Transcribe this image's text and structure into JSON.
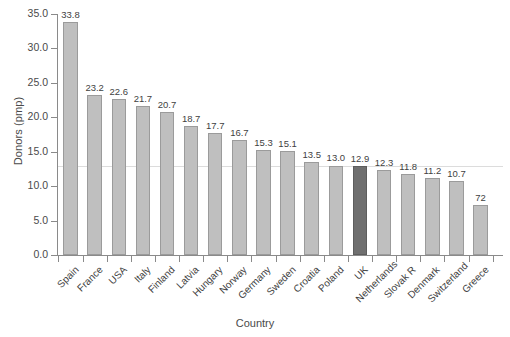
{
  "chart_data": {
    "type": "bar",
    "title": "",
    "xlabel": "Country",
    "ylabel": "Donors (pmp)",
    "ylim": [
      0,
      35
    ],
    "yticks": [
      "0.0",
      "5.0",
      "10.0",
      "15.0",
      "20.0",
      "25.0",
      "30.0",
      "35.0"
    ],
    "ytick_values": [
      0,
      5,
      10,
      15,
      20,
      25,
      30,
      35
    ],
    "grid": false,
    "legend": "none",
    "reference_line": 12.9,
    "highlight_category": "UK",
    "bar_color": "#bfbfbf",
    "bar_edge_color": "#9b9b9b",
    "highlight_color": "#6f6f6f",
    "axis_color": "#8a8a8a",
    "categories": [
      "Spain",
      "France",
      "USA",
      "Italy",
      "Finland",
      "Latvia",
      "Hungary",
      "Norway",
      "Germany",
      "Sweden",
      "Croatia",
      "Poland",
      "UK",
      "Netherlands",
      "Slovak R",
      "Denmark",
      "Switzerland",
      "Greece"
    ],
    "values": [
      33.8,
      23.2,
      22.6,
      21.7,
      20.7,
      18.7,
      17.7,
      16.7,
      15.3,
      15.1,
      13.5,
      13.0,
      12.9,
      12.3,
      11.8,
      11.2,
      10.7,
      7.2
    ],
    "value_labels": [
      "33.8",
      "23.2",
      "22.6",
      "21.7",
      "20.7",
      "18.7",
      "17.7",
      "16.7",
      "15.3",
      "15.1",
      "13.5",
      "13.0",
      "12.9",
      "12.3",
      "11.8",
      "11.2",
      "10.7",
      "72"
    ]
  }
}
